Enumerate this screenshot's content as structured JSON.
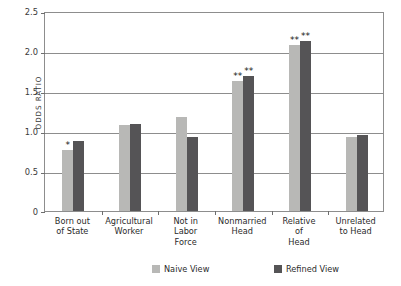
{
  "chart_data": {
    "type": "bar",
    "title": "",
    "subtitle": "",
    "xlabel": "",
    "ylabel": "ODDS RATIO",
    "ylim": [
      0,
      2.5
    ],
    "yticks": [
      "0",
      "0.5",
      "1.0",
      "1.5",
      "2.0",
      "2.5"
    ],
    "ytick_values": [
      0,
      0.5,
      1.0,
      1.5,
      2.0,
      2.5
    ],
    "grid": "horizontal",
    "legend_position": "bottom",
    "categories": [
      "Born out of State",
      "Agricultural Worker",
      "Not in Labor Force",
      "Nonmarried Head",
      "Relative of Head",
      "Unrelated to Head"
    ],
    "category_lines": [
      [
        "Born out",
        "of State"
      ],
      [
        "Agricultural",
        "Worker"
      ],
      [
        "Not in",
        "Labor",
        "Force"
      ],
      [
        "Nonmarried",
        "Head"
      ],
      [
        "Relative",
        "of",
        "Head"
      ],
      [
        "Unrelated",
        "to Head"
      ]
    ],
    "series": [
      {
        "name": "Naive View",
        "color": "#b8b8b6",
        "values": [
          0.76,
          1.08,
          1.18,
          1.63,
          2.07,
          0.92
        ],
        "significance": [
          "*",
          "",
          "",
          "**",
          "**",
          ""
        ]
      },
      {
        "name": "Refined View",
        "color": "#555456",
        "values": [
          0.88,
          1.09,
          0.93,
          1.69,
          2.13,
          0.95
        ],
        "significance": [
          "",
          "",
          "",
          "**",
          "**",
          ""
        ]
      }
    ],
    "legend": [
      {
        "label": "Naive View",
        "color": "#b8b8b6"
      },
      {
        "label": "Refined View",
        "color": "#555456"
      }
    ]
  }
}
